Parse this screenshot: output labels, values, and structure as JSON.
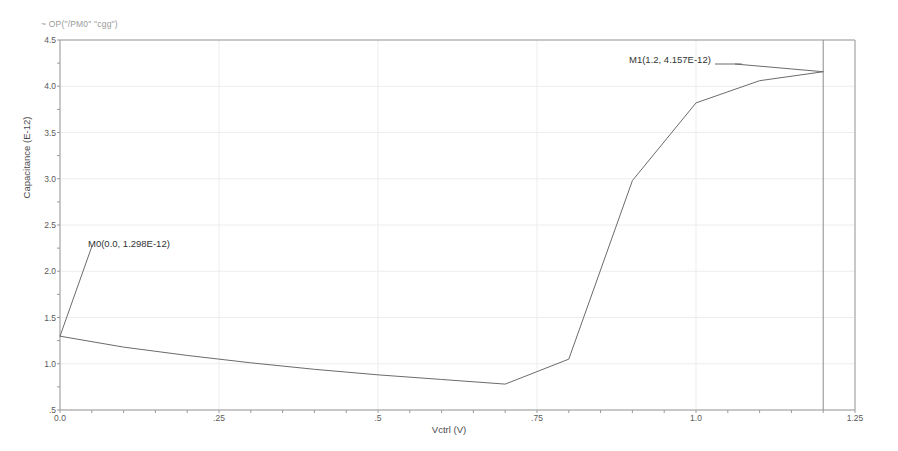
{
  "chart_data": {
    "type": "line",
    "title": "",
    "trace_expression": "~ OP(\"/PM0\" \"cgg\")",
    "xlabel": "Vctrl (V)",
    "ylabel": "Capacitance (E-12)",
    "xlim": [
      0.0,
      1.25
    ],
    "ylim": [
      0.5,
      4.5
    ],
    "grid": true,
    "legend_position": "none",
    "xticks": [
      "0.0",
      ".25",
      ".5",
      ".75",
      "1.0",
      "1.25"
    ],
    "xtick_values": [
      0.0,
      0.25,
      0.5,
      0.75,
      1.0,
      1.25
    ],
    "yticks": [
      "4.5",
      "4.0",
      "3.5",
      "3.0",
      "2.5",
      "2.0",
      "1.5",
      "1.0",
      ".5"
    ],
    "ytick_values": [
      4.5,
      4.0,
      3.5,
      3.0,
      2.5,
      2.0,
      1.5,
      1.0,
      0.5
    ],
    "series": [
      {
        "name": "cgg",
        "color": "#6b6b6b",
        "x": [
          0.0,
          0.1,
          0.2,
          0.3,
          0.4,
          0.5,
          0.6,
          0.7,
          0.8,
          0.9,
          1.0,
          1.1,
          1.2
        ],
        "y": [
          1.298,
          1.18,
          1.09,
          1.01,
          0.94,
          0.88,
          0.83,
          0.78,
          1.05,
          2.98,
          3.82,
          4.06,
          4.157
        ]
      }
    ],
    "annotations": [
      {
        "name": "M0",
        "label": "M0(0.0, 1.298E-12)",
        "x": 0.0,
        "y": 1.298
      },
      {
        "name": "M1",
        "label": "M1(1.2, 4.157E-12)",
        "x": 1.2,
        "y": 4.157
      }
    ],
    "cursor_lines": [
      {
        "name": "m1-cursor",
        "orientation": "vertical",
        "x": 1.2
      }
    ],
    "colors": {
      "trace": "#6b6b6b",
      "axis": "#9a9a9a",
      "grid": "#ededed",
      "cursor": "#8a8a8a",
      "text": "#3a3a3a",
      "background": "#ffffff"
    }
  }
}
